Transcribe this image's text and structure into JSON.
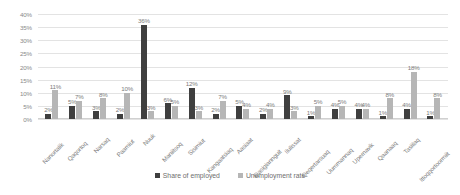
{
  "chart_data": {
    "type": "bar",
    "title": "",
    "xlabel": "",
    "ylabel": "",
    "ylim": [
      0,
      40
    ],
    "ytick_step": 5,
    "ytick_labels": [
      "0%",
      "5%",
      "10%",
      "15%",
      "20%",
      "25%",
      "30%",
      "35%",
      "40%"
    ],
    "grid": true,
    "legend_position": "bottom",
    "value_suffix": "%",
    "categories": [
      "Nanortalik",
      "Qaqortoq",
      "Narsaq",
      "Paamiut",
      "Nuuk",
      "Maniitsoq",
      "Sisimiut",
      "Kangaatsiaq",
      "Aasiaat",
      "Qasigiannguit",
      "Ilulissat",
      "Qeqertarsuaq",
      "Uummannaq",
      "Upernavik",
      "Qaanaaq",
      "Tasiilaq",
      "Ittoqqortoormiit"
    ],
    "series": [
      {
        "name": "Share of employed",
        "color": "#3f3f3f",
        "values": [
          2,
          5,
          3,
          2,
          36,
          6,
          12,
          2,
          5,
          2,
          9,
          1,
          4,
          4,
          1,
          4,
          1
        ],
        "labels": [
          "2%",
          "5%",
          "3%",
          "2%",
          "36%",
          "6%",
          "12%",
          "2%",
          "5%",
          "2%",
          "9%",
          "1%",
          "4%",
          "4%",
          "1%",
          "4%",
          "1%"
        ]
      },
      {
        "name": "Unemployment rate",
        "color": "#b6b6b6",
        "values": [
          11,
          7,
          8,
          10,
          3,
          5,
          3,
          7,
          4,
          4,
          3,
          5,
          5,
          4,
          8,
          18,
          8
        ],
        "labels": [
          "11%",
          "7%",
          "8%",
          "10%",
          "3%",
          "5%",
          "3%",
          "7%",
          "4%",
          "4%",
          "3%",
          "5%",
          "5%",
          "4%",
          "8%",
          "18%",
          "8%"
        ]
      }
    ]
  },
  "legend": {
    "items": [
      {
        "label": "Share of employed"
      },
      {
        "label": "Unemployment rate"
      }
    ]
  }
}
